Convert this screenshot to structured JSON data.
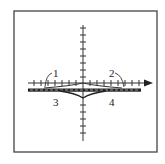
{
  "figure": {
    "type": "axes-diagram",
    "frame": {
      "x": 14,
      "y": 11,
      "w": 143,
      "h": 141,
      "color": "#333333"
    },
    "axes": {
      "origin": [
        83,
        83
      ],
      "x_axis": {
        "from": 28,
        "to": 152,
        "arrow": "right",
        "tick_spacing": 7
      },
      "y_axis": {
        "from": 25,
        "to": 141,
        "arrow": "none",
        "tick_spacing": 7
      }
    },
    "band": {
      "y": 90,
      "x_from": 28,
      "x_to": 141,
      "thickness": 3,
      "color": "#222222"
    },
    "dashed_line": {
      "y": 89,
      "x_from": 30,
      "x_to": 140
    },
    "labels": [
      {
        "id": "1",
        "text": "1",
        "x": 53,
        "y": 77
      },
      {
        "id": "2",
        "text": "2",
        "x": 109,
        "y": 77
      },
      {
        "id": "3",
        "text": "3",
        "x": 53,
        "y": 106
      },
      {
        "id": "4",
        "text": "4",
        "x": 109,
        "y": 106
      }
    ],
    "curves": {
      "upper_cusp_curve": "curves 1 and 2 meet at a cusp on the origin",
      "lower_dip_curve": "curves 3 and 4 dip below the band to a minimum on the y-axis"
    }
  }
}
